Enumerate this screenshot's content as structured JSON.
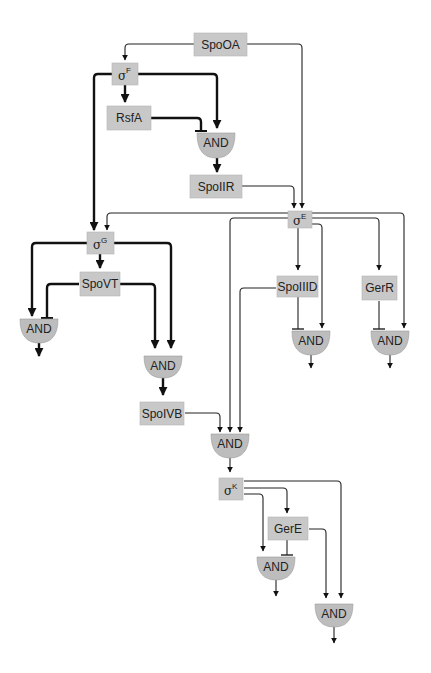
{
  "diagram": {
    "nodes": {
      "spo0a": {
        "label": "SpoOA"
      },
      "sigmaF": {
        "symbol": "σ",
        "sup": "F"
      },
      "rsfa": {
        "label": "RsfA"
      },
      "spoiir": {
        "label": "SpoIIR"
      },
      "sigmaE": {
        "symbol": "σ",
        "sup": "E"
      },
      "sigmaG": {
        "symbol": "σ",
        "sup": "G"
      },
      "spovt": {
        "label": "SpoVT"
      },
      "spoiiid": {
        "label": "SpoIIID"
      },
      "gerr": {
        "label": "GerR"
      },
      "spoivb": {
        "label": "SpoIVB"
      },
      "sigmaK": {
        "symbol": "σ",
        "sup": "K"
      },
      "gere": {
        "label": "GerE"
      }
    },
    "gates": {
      "and1": {
        "label": "AND"
      },
      "and_g_left": {
        "label": "AND"
      },
      "and_g_mid": {
        "label": "AND"
      },
      "and_e1": {
        "label": "AND"
      },
      "and_e2": {
        "label": "AND"
      },
      "and_k_in": {
        "label": "AND"
      },
      "and_k1": {
        "label": "AND"
      },
      "and_k2": {
        "label": "AND"
      }
    },
    "colors": {
      "node_fill": "#c8c8c8",
      "gate_fill": "#bdbdbd",
      "line": "#111111"
    }
  }
}
